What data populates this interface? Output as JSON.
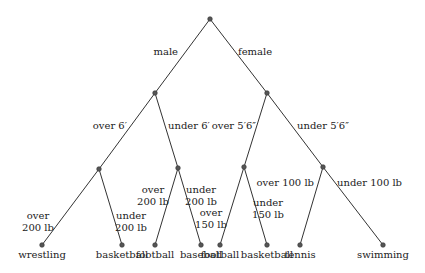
{
  "diagram": {
    "type": "decision-tree",
    "nodes": [
      {
        "id": "root",
        "x": 210,
        "y": 19
      },
      {
        "id": "n_male",
        "x": 155,
        "y": 93
      },
      {
        "id": "n_female",
        "x": 267,
        "y": 93
      },
      {
        "id": "n_m_over6",
        "x": 99,
        "y": 169
      },
      {
        "id": "n_m_under6",
        "x": 178,
        "y": 168
      },
      {
        "id": "n_f_over56",
        "x": 244,
        "y": 167
      },
      {
        "id": "n_f_under56",
        "x": 323,
        "y": 167
      },
      {
        "id": "leaf_wrestling",
        "x": 42,
        "y": 245,
        "label": "wrestling"
      },
      {
        "id": "leaf_basketball_1",
        "x": 122,
        "y": 245,
        "label": "basketball"
      },
      {
        "id": "leaf_football_1",
        "x": 155,
        "y": 245,
        "label": "football"
      },
      {
        "id": "leaf_baseball",
        "x": 201,
        "y": 245,
        "label": "baseball"
      },
      {
        "id": "leaf_football_2",
        "x": 220,
        "y": 245,
        "label": "football"
      },
      {
        "id": "leaf_basketball_2",
        "x": 267,
        "y": 245,
        "label": "basketball"
      },
      {
        "id": "leaf_tennis",
        "x": 300,
        "y": 245,
        "label": "tennis"
      },
      {
        "id": "leaf_swimming",
        "x": 383,
        "y": 245,
        "label": "swimming"
      }
    ],
    "edges": [
      {
        "from": "root",
        "to": "n_male",
        "label": [
          "male"
        ],
        "lx": 178,
        "ly": 55,
        "anchor": "end"
      },
      {
        "from": "root",
        "to": "n_female",
        "label": [
          "female"
        ],
        "lx": 238,
        "ly": 55,
        "anchor": "start"
      },
      {
        "from": "n_male",
        "to": "n_m_over6",
        "label": [
          "over 6′"
        ],
        "lx": 127,
        "ly": 129,
        "anchor": "end"
      },
      {
        "from": "n_male",
        "to": "n_m_under6",
        "label": [
          "under 6′"
        ],
        "lx": 168,
        "ly": 129,
        "anchor": "start"
      },
      {
        "from": "n_female",
        "to": "n_f_over56",
        "label": [
          "over 5′6″"
        ],
        "lx": 256,
        "ly": 129,
        "anchor": "end"
      },
      {
        "from": "n_female",
        "to": "n_f_under56",
        "label": [
          "under 5′6″"
        ],
        "lx": 297,
        "ly": 129,
        "anchor": "start"
      },
      {
        "from": "n_m_over6",
        "to": "leaf_wrestling",
        "label": [
          "over",
          "200 lb"
        ],
        "lx": 38,
        "ly": 219,
        "anchor": "middle"
      },
      {
        "from": "n_m_over6",
        "to": "leaf_basketball_1",
        "label": [
          "under",
          "200 lb"
        ],
        "lx": 131,
        "ly": 219,
        "anchor": "middle"
      },
      {
        "from": "n_m_under6",
        "to": "leaf_football_1",
        "label": [
          "over",
          "200 lb"
        ],
        "lx": 153,
        "ly": 193,
        "anchor": "middle"
      },
      {
        "from": "n_m_under6",
        "to": "leaf_baseball",
        "label": [
          "under",
          "200 lb"
        ],
        "lx": 201,
        "ly": 193,
        "anchor": "middle"
      },
      {
        "from": "n_f_over56",
        "to": "leaf_football_2",
        "label": [
          "over",
          "150 lb"
        ],
        "lx": 211,
        "ly": 216,
        "anchor": "middle"
      },
      {
        "from": "n_f_over56",
        "to": "leaf_basketball_2",
        "label": [
          "under",
          "150 lb"
        ],
        "lx": 268,
        "ly": 206,
        "anchor": "middle"
      },
      {
        "from": "n_f_under56",
        "to": "leaf_tennis",
        "label": [
          "over 100 lb"
        ],
        "lx": 314,
        "ly": 186,
        "anchor": "end"
      },
      {
        "from": "n_f_under56",
        "to": "leaf_swimming",
        "label": [
          "under 100 lb"
        ],
        "lx": 337,
        "ly": 186,
        "anchor": "start"
      }
    ]
  }
}
